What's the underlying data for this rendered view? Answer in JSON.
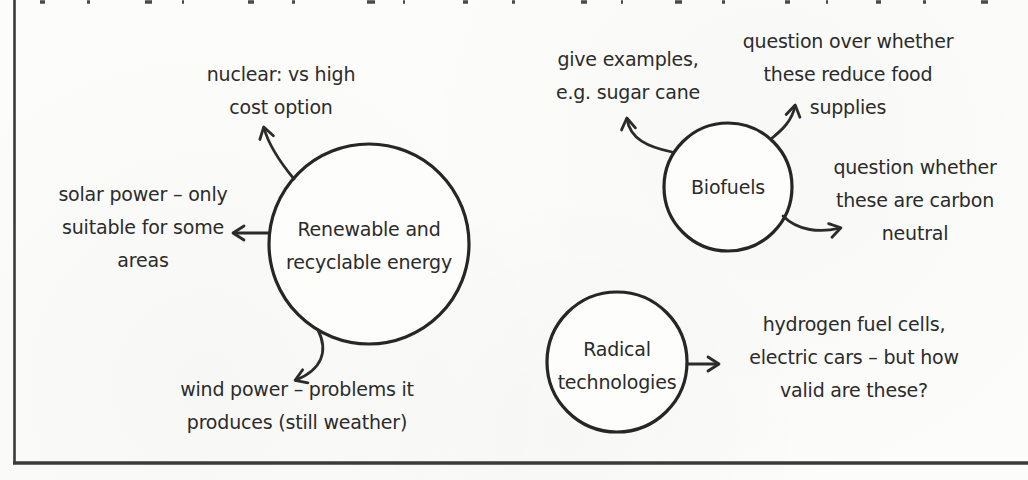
{
  "figure": {
    "type": "mind-map",
    "ink_color": "#2b2b2b",
    "paper_color": "#fcfcfa",
    "mindmap": {
      "nodes": {
        "renewable": {
          "label": "Renewable and\nrecyclable energy"
        },
        "biofuels": {
          "label": "Biofuels"
        },
        "radical": {
          "label": "Radical\ntechnologies"
        }
      },
      "branches": {
        "nuclear": {
          "node": "renewable",
          "text": "nuclear: vs high\ncost option"
        },
        "solar": {
          "node": "renewable",
          "text": "solar power – only\nsuitable for some\nareas"
        },
        "wind": {
          "node": "renewable",
          "text": "wind power – problems it\nproduces (still weather)"
        },
        "examples": {
          "node": "biofuels",
          "text": "give examples,\ne.g. sugar cane"
        },
        "food": {
          "node": "biofuels",
          "text": "question over whether\nthese reduce food\nsupplies"
        },
        "carbon": {
          "node": "biofuels",
          "text": "question whether\nthese are carbon\nneutral"
        },
        "hydrogen": {
          "node": "radical",
          "text": "hydrogen fuel cells,\nelectric cars – but how\nvalid are these?"
        }
      }
    }
  }
}
